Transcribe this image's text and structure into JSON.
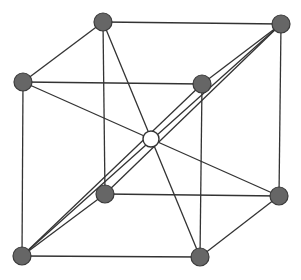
{
  "colors": {
    "background": "#ffffff",
    "line": "#333333",
    "corner_atom_fill": "#666666",
    "corner_atom_stroke": "#3a3a3a",
    "center_atom_fill": "#ffffff",
    "center_atom_stroke": "#333333"
  },
  "atoms": {
    "corner_radius": 9,
    "center_radius": 8,
    "corners": [
      {
        "id": "top-back-left",
        "x": 103,
        "y": 22
      },
      {
        "id": "top-back-right",
        "x": 281,
        "y": 24
      },
      {
        "id": "top-front-left",
        "x": 23,
        "y": 82
      },
      {
        "id": "top-front-right",
        "x": 202,
        "y": 84
      },
      {
        "id": "bottom-back-left",
        "x": 105,
        "y": 194
      },
      {
        "id": "bottom-back-right",
        "x": 279,
        "y": 196
      },
      {
        "id": "bottom-front-left",
        "x": 22,
        "y": 256
      },
      {
        "id": "bottom-front-right",
        "x": 200,
        "y": 257
      }
    ],
    "center": {
      "id": "body-center",
      "x": 151,
      "y": 139
    }
  },
  "lines": [
    [
      "top-back-left",
      "top-back-right"
    ],
    [
      "top-front-left",
      "top-front-right"
    ],
    [
      "top-back-left",
      "top-front-left"
    ],
    [
      "top-back-right",
      "top-front-right"
    ],
    [
      "bottom-back-left",
      "bottom-back-right"
    ],
    [
      "bottom-front-left",
      "bottom-front-right"
    ],
    [
      "bottom-back-left",
      "bottom-front-left"
    ],
    [
      "bottom-back-right",
      "bottom-front-right"
    ],
    [
      "top-back-left",
      "bottom-back-left"
    ],
    [
      "top-back-right",
      "bottom-back-right"
    ],
    [
      "top-front-left",
      "bottom-front-left"
    ],
    [
      "top-front-right",
      "bottom-front-right"
    ],
    [
      "top-back-left",
      "bottom-front-right"
    ],
    [
      "top-front-left",
      "bottom-back-right"
    ],
    [
      "bottom-front-left",
      "top-back-right"
    ],
    [
      "bottom-front-left",
      "top-front-right"
    ],
    [
      "bottom-back-left",
      "top-back-right"
    ]
  ]
}
